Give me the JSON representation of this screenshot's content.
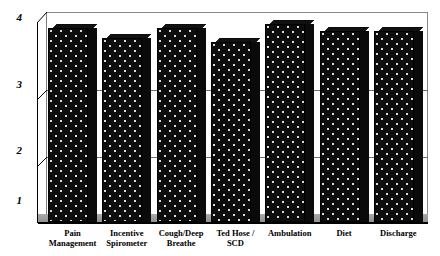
{
  "chart_data": {
    "type": "bar",
    "title": "",
    "xlabel": "",
    "ylabel": "",
    "ylim": [
      1,
      4
    ],
    "yticks": [
      "1",
      "2",
      "3",
      "4"
    ],
    "grid": true,
    "legend": "none",
    "style": "3d-bar",
    "categories": [
      "Pain Management",
      "Incentive Spirometer",
      "Cough/Deep Breathe",
      "Ted Hose / SCD",
      "Ambulation",
      "Diet",
      "Discharge"
    ],
    "category_lines": [
      [
        "Pain",
        "Management"
      ],
      [
        "Incentive",
        "Spirometer"
      ],
      [
        "Cough/Deep",
        "Breathe"
      ],
      [
        "Ted Hose /",
        "SCD"
      ],
      [
        "Ambulation",
        ""
      ],
      [
        "Diet",
        ""
      ],
      [
        "Discharge",
        ""
      ]
    ],
    "values": [
      3.92,
      3.77,
      3.92,
      3.71,
      3.98,
      3.88,
      3.88
    ],
    "bar_color": "#0d0d0d",
    "bar_pattern": "white-dot-fill",
    "background_color": "#ffffff",
    "grid_color": "#6e6e6e",
    "floor_color": "#9b9b9b"
  }
}
